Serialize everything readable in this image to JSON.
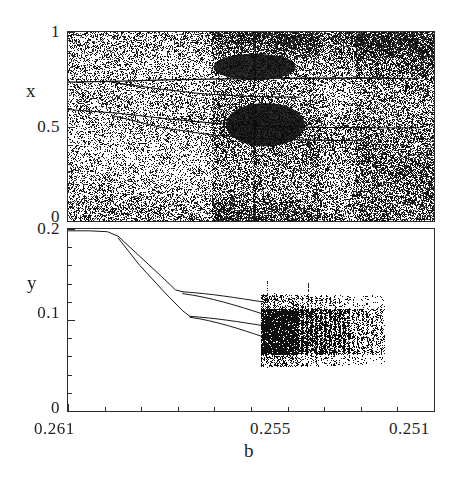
{
  "figure": {
    "type": "bifurcation-diagram-pair",
    "background": "#ffffff",
    "ink": "#1a1a1a"
  },
  "xaxis": {
    "label": "b",
    "tick_labels": [
      "0.261",
      "0.255",
      "0.251"
    ],
    "tick_values": [
      0.261,
      0.255,
      0.251
    ],
    "range": [
      0.261,
      0.2508
    ],
    "direction": "decreasing",
    "minor_tick_count": 10
  },
  "panels": [
    {
      "id": "upper",
      "ylabel": "x",
      "tick_labels": [
        "1",
        "0.5",
        "0"
      ],
      "tick_values": [
        1,
        0.5,
        0
      ],
      "ylim": [
        0,
        1
      ]
    },
    {
      "id": "lower",
      "ylabel": "y",
      "tick_labels": [
        "0.2",
        "0.1",
        "0"
      ],
      "tick_values": [
        0.2,
        0.1,
        0
      ],
      "ylim": [
        0,
        0.2
      ]
    }
  ],
  "chart_data": [
    {
      "type": "scatter",
      "id": "upper-panel-x",
      "title": "",
      "xlabel": "b",
      "ylabel": "x",
      "xlim": [
        0.261,
        0.2508
      ],
      "ylim": [
        0,
        1
      ],
      "x_tick_labels": [
        "0.261",
        "0.255",
        "0.251"
      ],
      "y_tick_labels": [
        "1",
        "0.5",
        "0"
      ],
      "grid": false,
      "legend": "none",
      "description": "Dense chaotic bifurcation scatter filling the full 0-1 range of x, rendered as a coarse dithered halftone. Faint deterministic branch curves are visible on top of the noise: an upper branch near x=0.75 and a mid branch near x=0.5 that split leftward into a period-doubling fan. Darkened high-density bands appear between b=0.2570 and b=0.2540 and again from b=0.2530 rightward.",
      "density_bands": [
        {
          "b_start": 0.261,
          "b_end": 0.257,
          "density": 0.45,
          "note": "moderate speckle"
        },
        {
          "b_start": 0.257,
          "b_end": 0.254,
          "density": 0.78,
          "note": "dark dense band"
        },
        {
          "b_start": 0.254,
          "b_end": 0.253,
          "density": 0.62,
          "note": "transition"
        },
        {
          "b_start": 0.253,
          "b_end": 0.2508,
          "density": 0.82,
          "note": "fully chaotic dark"
        }
      ],
      "branches": [
        {
          "name": "upper-branch",
          "points": [
            [
              0.261,
              0.735
            ],
            [
              0.2595,
              0.74
            ],
            [
              0.258,
              0.748
            ],
            [
              0.2565,
              0.752
            ],
            [
              0.255,
              0.755
            ],
            [
              0.2535,
              0.757
            ],
            [
              0.252,
              0.758
            ]
          ]
        },
        {
          "name": "upper-branch-split",
          "points": [
            [
              0.2598,
              0.735
            ],
            [
              0.2585,
              0.7
            ],
            [
              0.2572,
              0.672
            ],
            [
              0.256,
              0.66
            ],
            [
              0.2545,
              0.655
            ]
          ]
        },
        {
          "name": "mid-branch",
          "points": [
            [
              0.261,
              0.59
            ],
            [
              0.2596,
              0.57
            ],
            [
              0.2582,
              0.54
            ],
            [
              0.2568,
              0.515
            ],
            [
              0.2552,
              0.5
            ],
            [
              0.2538,
              0.495
            ],
            [
              0.2524,
              0.493
            ]
          ]
        },
        {
          "name": "mid-branch-split",
          "points": [
            [
              0.2598,
              0.56
            ],
            [
              0.2584,
              0.495
            ],
            [
              0.257,
              0.455
            ],
            [
              0.2556,
              0.435
            ],
            [
              0.2542,
              0.428
            ],
            [
              0.2528,
              0.425
            ]
          ]
        }
      ]
    },
    {
      "type": "scatter",
      "id": "lower-panel-y",
      "title": "",
      "xlabel": "b",
      "ylabel": "y",
      "xlim": [
        0.261,
        0.2508
      ],
      "ylim": [
        0,
        0.2
      ],
      "x_tick_labels": [
        "0.261",
        "0.255",
        "0.251"
      ],
      "y_tick_labels": [
        "0.2",
        "0.1",
        "0"
      ],
      "grid": false,
      "legend": "none",
      "description": "Clean period-doubling cascade. A single fixed point sits flat at y=0.198, drops steeply, splits into two branches near b=0.2593, each of which splits again near b=0.2578 giving four branches that converge and descend slowly, then collapse into a dense chaotic band beginning at b=0.2556 which continues with vertical striping to about b=0.2522.",
      "period1": [
        [
          0.261,
          0.198
        ],
        [
          0.2604,
          0.198
        ],
        [
          0.2599,
          0.197
        ],
        [
          0.2596,
          0.192
        ]
      ],
      "branches": [
        {
          "name": "p2-upper",
          "points": [
            [
              0.2596,
              0.192
            ],
            [
              0.259,
              0.17
            ],
            [
              0.2584,
              0.148
            ],
            [
              0.258,
              0.133
            ],
            [
              0.2578,
              0.131
            ]
          ]
        },
        {
          "name": "p2-lower",
          "points": [
            [
              0.2596,
              0.19
            ],
            [
              0.259,
              0.16
            ],
            [
              0.2583,
              0.13
            ],
            [
              0.2578,
              0.11
            ],
            [
              0.2576,
              0.104
            ]
          ]
        },
        {
          "name": "p4-a",
          "points": [
            [
              0.2578,
              0.131
            ],
            [
              0.257,
              0.128
            ],
            [
              0.256,
              0.122
            ],
            [
              0.255,
              0.117
            ],
            [
              0.2562,
              0.12
            ]
          ]
        },
        {
          "name": "p4-b",
          "points": [
            [
              0.2578,
              0.129
            ],
            [
              0.2568,
              0.122
            ],
            [
              0.2558,
              0.112
            ],
            [
              0.2548,
              0.102
            ],
            [
              0.2556,
              0.107
            ]
          ]
        },
        {
          "name": "p4-c",
          "points": [
            [
              0.2576,
              0.104
            ],
            [
              0.2568,
              0.101
            ],
            [
              0.2558,
              0.096
            ],
            [
              0.2548,
              0.091
            ],
            [
              0.2556,
              0.094
            ]
          ]
        },
        {
          "name": "p4-d",
          "points": [
            [
              0.2576,
              0.103
            ],
            [
              0.2566,
              0.096
            ],
            [
              0.2556,
              0.086
            ],
            [
              0.2548,
              0.078
            ],
            [
              0.2556,
              0.082
            ]
          ]
        }
      ],
      "chaos_region": {
        "b_start": 0.2556,
        "b_end": 0.2522,
        "y_min": 0.048,
        "y_max": 0.128,
        "y_core_min": 0.062,
        "y_core_max": 0.112,
        "spike_max": 0.145
      }
    }
  ]
}
